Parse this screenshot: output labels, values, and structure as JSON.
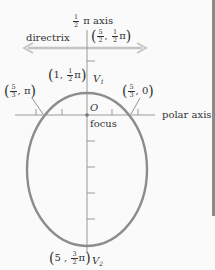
{
  "diagram": {
    "type": "polar-conic-ellipse",
    "colors": {
      "ellipse": "#8c8c8c",
      "axis": "#9a9a9a",
      "directrix": "#bdbdbd",
      "text": "#333333",
      "edge_bar": "#8a8a8a"
    },
    "labels": {
      "vertical_axis": {
        "frac_num": "1",
        "frac_den": "2",
        "rest": "π axis"
      },
      "directrix": "directrix",
      "directrix_point": {
        "open": "(",
        "a_num": "5",
        "a_den": "2",
        "sep": ",",
        "b_num": "1",
        "b_den": "2",
        "pi": "π",
        "close": ")"
      },
      "v1_point": {
        "open": "(",
        "a": "1",
        "sep": ",",
        "b_num": "1",
        "b_den": "2",
        "pi": "π",
        "close": ")"
      },
      "v1_name": "V",
      "v1_sub": "1",
      "left_point": {
        "open": "(",
        "a_num": "5",
        "a_den": "3",
        "sep": ",",
        "b": "π",
        "close": ")"
      },
      "right_point": {
        "open": "(",
        "a_num": "5",
        "a_den": "3",
        "sep": ",",
        "b": "0",
        "close": ")"
      },
      "origin": "O",
      "focus": "focus",
      "polar_axis": "polar axis",
      "v2_point": {
        "open": "(",
        "a": "5",
        "sep": ",",
        "b_num": "3",
        "b_den": "2",
        "pi": "π",
        "close": ")"
      },
      "v2_name": "V",
      "v2_sub": "2"
    }
  }
}
